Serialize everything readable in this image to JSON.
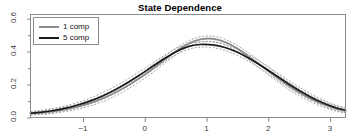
{
  "chart": {
    "title": "State Dependence",
    "xlabel": "",
    "ylabel": "",
    "legend": {
      "position": "top-left",
      "entries": [
        {
          "label": "1 comp",
          "color": "#8c8c8c",
          "width": 2.0
        },
        {
          "label": "5 comp",
          "color": "#1a1a1a",
          "width": 2.0
        }
      ]
    },
    "axes": {
      "x_ticks": [
        -1,
        0,
        1,
        2,
        3
      ],
      "x_tick_labels": [
        "−1",
        "0",
        "1",
        "2",
        "3"
      ],
      "y_ticks": [
        0.0,
        0.2,
        0.4,
        0.6
      ],
      "y_tick_labels": [
        "0.0",
        "0.2",
        "0.4",
        "0.6"
      ],
      "y_minor_ticks": [
        0.1,
        0.3,
        0.5
      ],
      "xlim": [
        -1.85,
        3.25
      ],
      "ylim": [
        0.0,
        0.625
      ],
      "grid": false,
      "box": true
    },
    "band_color": "#9a9a9a",
    "band_style": "dashed"
  },
  "chart_data": {
    "type": "line",
    "title": "State Dependence",
    "xlabel": "",
    "ylabel": "",
    "xlim": [
      -1.85,
      3.25
    ],
    "ylim": [
      0.0,
      0.625
    ],
    "grid": false,
    "legend_position": "top-left",
    "x": [
      -1.85,
      -1.7,
      -1.5,
      -1.3,
      -1.1,
      -0.9,
      -0.7,
      -0.5,
      -0.3,
      -0.1,
      0.1,
      0.3,
      0.5,
      0.7,
      0.9,
      1.1,
      1.3,
      1.5,
      1.7,
      1.9,
      2.1,
      2.3,
      2.5,
      2.7,
      2.9,
      3.1,
      3.25
    ],
    "series": [
      {
        "name": "1 comp",
        "color": "#8c8c8c",
        "values": [
          0.024,
          0.028,
          0.036,
          0.048,
          0.064,
          0.086,
          0.113,
          0.147,
          0.188,
          0.235,
          0.287,
          0.345,
          0.4,
          0.447,
          0.474,
          0.478,
          0.458,
          0.418,
          0.366,
          0.31,
          0.254,
          0.2,
          0.152,
          0.112,
          0.079,
          0.053,
          0.04
        ],
        "band_upper": [
          0.034,
          0.039,
          0.049,
          0.062,
          0.08,
          0.104,
          0.133,
          0.168,
          0.21,
          0.258,
          0.31,
          0.366,
          0.42,
          0.464,
          0.49,
          0.494,
          0.475,
          0.437,
          0.387,
          0.332,
          0.277,
          0.222,
          0.173,
          0.131,
          0.096,
          0.069,
          0.055
        ],
        "band_lower": [
          0.014,
          0.018,
          0.024,
          0.035,
          0.049,
          0.069,
          0.094,
          0.127,
          0.167,
          0.213,
          0.264,
          0.323,
          0.38,
          0.429,
          0.457,
          0.461,
          0.441,
          0.399,
          0.345,
          0.288,
          0.231,
          0.178,
          0.131,
          0.093,
          0.062,
          0.038,
          0.026
        ]
      },
      {
        "name": "5 comp",
        "color": "#1a1a1a",
        "values": [
          0.026,
          0.031,
          0.041,
          0.055,
          0.074,
          0.098,
          0.128,
          0.164,
          0.206,
          0.253,
          0.303,
          0.353,
          0.398,
          0.43,
          0.443,
          0.441,
          0.425,
          0.396,
          0.357,
          0.311,
          0.261,
          0.211,
          0.164,
          0.122,
          0.087,
          0.059,
          0.045
        ],
        "band_upper": [
          0.036,
          0.042,
          0.054,
          0.069,
          0.09,
          0.116,
          0.148,
          0.185,
          0.228,
          0.275,
          0.324,
          0.373,
          0.416,
          0.447,
          0.459,
          0.458,
          0.443,
          0.415,
          0.377,
          0.332,
          0.283,
          0.233,
          0.185,
          0.141,
          0.104,
          0.075,
          0.06
        ],
        "band_lower": [
          0.016,
          0.02,
          0.028,
          0.041,
          0.058,
          0.08,
          0.108,
          0.143,
          0.184,
          0.231,
          0.282,
          0.333,
          0.38,
          0.413,
          0.427,
          0.424,
          0.407,
          0.377,
          0.337,
          0.29,
          0.239,
          0.189,
          0.143,
          0.103,
          0.07,
          0.043,
          0.03
        ]
      }
    ]
  }
}
